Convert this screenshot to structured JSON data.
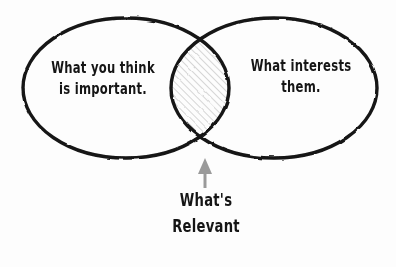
{
  "diagram": {
    "type": "venn-diagram",
    "title_present": false,
    "background_color": "#fdfdfd",
    "stroke_color": "#141414",
    "hatch_color": "#c9c9c9",
    "arrow_color": "#9a9a9a",
    "sets": [
      {
        "id": "left",
        "label": "What you think\nis important.",
        "cx": 126,
        "cy": 88,
        "rx": 103,
        "ry": 70
      },
      {
        "id": "right",
        "label": "What interests\nthem.",
        "cx": 274,
        "cy": 88,
        "rx": 103,
        "ry": 70
      }
    ],
    "intersection": {
      "label": "What's\nRelevant",
      "fill": "diagonal-hatch",
      "annotation_arrow": "up-arrow"
    }
  }
}
